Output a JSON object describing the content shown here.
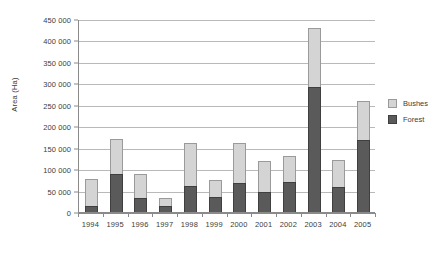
{
  "chart_data": {
    "type": "bar",
    "stacked": true,
    "title": "",
    "xlabel": "",
    "ylabel": "Area (Ha)",
    "ylim": [
      0,
      450000
    ],
    "ytick_step": 50000,
    "ytick_labels": [
      "0",
      "50 000",
      "100 000",
      "150 000",
      "200 000",
      "250 000",
      "300 000",
      "350 000",
      "400 000",
      "450 000"
    ],
    "ytick_values": [
      0,
      50000,
      100000,
      150000,
      200000,
      250000,
      300000,
      350000,
      400000,
      450000
    ],
    "grid": true,
    "legend_position": "right",
    "categories": [
      "1994",
      "1995",
      "1996",
      "1997",
      "1998",
      "1999",
      "2000",
      "2001",
      "2002",
      "2003",
      "2004",
      "2005"
    ],
    "series": [
      {
        "name": "Forest",
        "color": "#5a5a5a",
        "values": [
          15000,
          89000,
          32000,
          14000,
          61000,
          34000,
          68000,
          47000,
          70000,
          291000,
          59000,
          169000
        ]
      },
      {
        "name": "Bushes",
        "color": "#d4d4d4",
        "values": [
          63000,
          82000,
          57000,
          18000,
          99000,
          40000,
          94000,
          72000,
          60000,
          138000,
          63000,
          91000
        ]
      }
    ],
    "totals": [
      78000,
      171000,
      89000,
      32000,
      160000,
      74000,
      162000,
      119000,
      130000,
      429000,
      122000,
      260000
    ]
  },
  "legend": {
    "items": [
      {
        "label": "Bushes",
        "color": "#d4d4d4"
      },
      {
        "label": "Forest",
        "color": "#5a5a5a"
      }
    ]
  },
  "colors": {
    "bushes": "#d4d4d4",
    "forest": "#5a5a5a",
    "axis": "#8a8a8a",
    "grid": "#b9b9b9",
    "text": "#3c3c3c",
    "background": "#ffffff"
  }
}
